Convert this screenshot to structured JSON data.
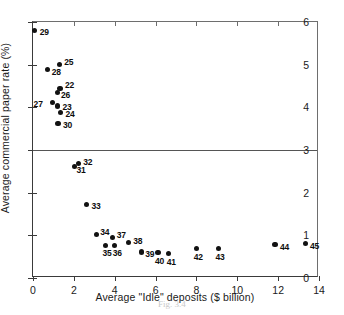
{
  "chart_data": {
    "type": "scatter",
    "title": "",
    "xlabel": "Average \"Idle\" deposits ($ billion)",
    "ylabel": "Average commercial paper rate (%)",
    "xlim": [
      0,
      14
    ],
    "ylim": [
      0,
      6
    ],
    "xticks": [
      0,
      2,
      4,
      6,
      8,
      10,
      12,
      14
    ],
    "yticks": [
      0,
      1,
      2,
      3,
      4,
      5,
      6
    ],
    "grid": "horizontal-line-at-y-3",
    "legend": "none",
    "points": [
      {
        "label": "29",
        "x": 0.08,
        "y": 5.8,
        "lab_dx": 5,
        "lab_dy": -4
      },
      {
        "label": "28",
        "x": 0.72,
        "y": 4.88,
        "lab_dx": 4,
        "lab_dy": -3
      },
      {
        "label": "25",
        "x": 1.28,
        "y": 5.0,
        "lab_dx": 5,
        "lab_dy": -8
      },
      {
        "label": "22",
        "x": 1.32,
        "y": 4.45,
        "lab_dx": 5,
        "lab_dy": -8
      },
      {
        "label": "26",
        "x": 1.18,
        "y": 4.34,
        "lab_dx": 4,
        "lab_dy": -3
      },
      {
        "label": "27",
        "x": 0.96,
        "y": 4.11,
        "lab_dx": -19,
        "lab_dy": -4
      },
      {
        "label": "23",
        "x": 1.2,
        "y": 4.03,
        "lab_dx": 5,
        "lab_dy": -4
      },
      {
        "label": "24",
        "x": 1.35,
        "y": 3.88,
        "lab_dx": 5,
        "lab_dy": -3
      },
      {
        "label": "30",
        "x": 1.22,
        "y": 3.63,
        "lab_dx": 5,
        "lab_dy": -3
      },
      {
        "label": "32",
        "x": 2.22,
        "y": 2.68,
        "lab_dx": 5,
        "lab_dy": -7
      },
      {
        "label": "31",
        "x": 2.03,
        "y": 2.62,
        "lab_dx": 2,
        "lab_dy": -1
      },
      {
        "label": "33",
        "x": 2.62,
        "y": 1.73,
        "lab_dx": 5,
        "lab_dy": -3
      },
      {
        "label": "34",
        "x": 3.1,
        "y": 1.02,
        "lab_dx": 4,
        "lab_dy": -7
      },
      {
        "label": "37",
        "x": 3.9,
        "y": 0.95,
        "lab_dx": 4,
        "lab_dy": -7
      },
      {
        "label": "35",
        "x": 3.55,
        "y": 0.77,
        "lab_dx": -3,
        "lab_dy": 3
      },
      {
        "label": "36",
        "x": 4.0,
        "y": 0.77,
        "lab_dx": -2,
        "lab_dy": 3
      },
      {
        "label": "38",
        "x": 4.66,
        "y": 0.83,
        "lab_dx": 5,
        "lab_dy": -7
      },
      {
        "label": "39",
        "x": 5.3,
        "y": 0.61,
        "lab_dx": 4,
        "lab_dy": -3
      },
      {
        "label": "40",
        "x": 6.12,
        "y": 0.6,
        "lab_dx": -3,
        "lab_dy": 4
      },
      {
        "label": "41",
        "x": 6.65,
        "y": 0.58,
        "lab_dx": -2,
        "lab_dy": 4
      },
      {
        "label": "42",
        "x": 8.02,
        "y": 0.7,
        "lab_dx": -3,
        "lab_dy": 4
      },
      {
        "label": "43",
        "x": 9.08,
        "y": 0.7,
        "lab_dx": -3,
        "lab_dy": 4
      },
      {
        "label": "44",
        "x": 11.85,
        "y": 0.78,
        "lab_dx": 5,
        "lab_dy": -3
      },
      {
        "label": "45",
        "x": 13.32,
        "y": 0.8,
        "lab_dx": 5,
        "lab_dy": -3
      }
    ]
  },
  "caption": "Fig. 3.4"
}
